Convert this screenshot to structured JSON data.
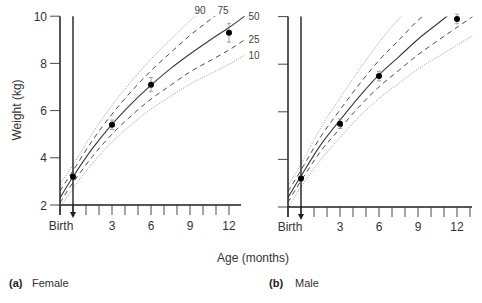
{
  "figure": {
    "ylabel": "Weight (kg)",
    "xlabel": "Age (months)",
    "panels": [
      {
        "tag": "(a)",
        "title": "Female"
      },
      {
        "tag": "(b)",
        "title": "Male"
      }
    ]
  },
  "chart_data": [
    {
      "type": "line",
      "title": "(a) Female",
      "xlabel": "Age (months)",
      "ylabel": "Weight (kg)",
      "xlim": [
        -1,
        13
      ],
      "ylim": [
        2,
        10
      ],
      "x_ticks": [
        0,
        3,
        6,
        9,
        12
      ],
      "x_tick_labels": [
        "Birth",
        "3",
        "6",
        "9",
        "12"
      ],
      "x_minor_ticks_every": 1,
      "y_ticks": [
        2,
        4,
        6,
        8,
        10
      ],
      "y_tick_labels": [
        "2",
        "4",
        "6",
        "8",
        "10"
      ],
      "grid": false,
      "birth_marker": {
        "x": 0,
        "style": "vertical arrow"
      },
      "series": [
        {
          "name": "90",
          "line_style": "dotted",
          "label_visible": true,
          "x": [
            -1,
            0,
            1.5,
            3,
            4.5,
            6,
            7.5,
            9,
            10.5
          ],
          "values": [
            2.9,
            3.7,
            5.05,
            6.22,
            7.25,
            8.18,
            9.0,
            9.8,
            10.5
          ]
        },
        {
          "name": "75",
          "line_style": "dashed",
          "label_visible": true,
          "x": [
            -1,
            0,
            1.5,
            3,
            4.5,
            6,
            7.5,
            9,
            10.5,
            12
          ],
          "values": [
            2.6,
            3.45,
            4.74,
            5.85,
            6.82,
            7.69,
            8.45,
            9.19,
            9.83,
            10.45
          ]
        },
        {
          "name": "50",
          "line_style": "solid",
          "label_visible": true,
          "x": [
            -1,
            0,
            1.5,
            3,
            4.5,
            6,
            7.5,
            9,
            10.5,
            12,
            13.2
          ],
          "values": [
            2.3,
            3.2,
            4.4,
            5.42,
            6.3,
            7.08,
            7.78,
            8.4,
            8.97,
            9.52,
            10.0
          ]
        },
        {
          "name": "25",
          "line_style": "dashed",
          "label_visible": true,
          "x": [
            -1,
            0,
            1.5,
            3,
            4.5,
            6,
            7.5,
            9,
            10.5,
            12,
            13.2
          ],
          "values": [
            2.1,
            2.95,
            4.06,
            5.0,
            5.79,
            6.49,
            7.07,
            7.64,
            8.1,
            8.57,
            9.0
          ]
        },
        {
          "name": "10",
          "line_style": "dotted",
          "label_visible": true,
          "x": [
            -1,
            0,
            1.5,
            3,
            4.5,
            6,
            7.5,
            9,
            10.5,
            12,
            13.2
          ],
          "values": [
            1.9,
            2.7,
            3.77,
            4.66,
            5.41,
            6.06,
            6.6,
            7.12,
            7.54,
            7.96,
            8.35
          ]
        }
      ],
      "points": {
        "name": "Measured weight",
        "x": [
          0,
          3,
          6,
          12
        ],
        "values": [
          3.2,
          5.4,
          7.1,
          9.3
        ],
        "error": [
          0.1,
          0.2,
          0.3,
          0.4
        ]
      }
    },
    {
      "type": "line",
      "title": "(b) Male",
      "xlabel": "Age (months)",
      "ylabel": "Weight (kg)",
      "xlim": [
        -1,
        13
      ],
      "ylim": [
        2,
        10
      ],
      "x_ticks": [
        0,
        3,
        6,
        9,
        12
      ],
      "x_tick_labels": [
        "Birth",
        "3",
        "6",
        "9",
        "12"
      ],
      "x_minor_ticks_every": 1,
      "y_ticks": [
        2,
        4,
        6,
        8,
        10
      ],
      "y_tick_labels": [],
      "grid": false,
      "birth_marker": {
        "x": 0,
        "style": "vertical arrow"
      },
      "series": [
        {
          "name": "90",
          "line_style": "dotted",
          "label_visible": false,
          "x": [
            -1,
            0,
            1.5,
            3,
            4.5,
            6,
            7.5,
            9
          ],
          "values": [
            2.9,
            3.8,
            5.31,
            6.58,
            7.79,
            8.91,
            9.88,
            10.6
          ]
        },
        {
          "name": "75",
          "line_style": "dashed",
          "label_visible": false,
          "x": [
            -1,
            0,
            1.5,
            3,
            4.5,
            6,
            7.5,
            9,
            10.5
          ],
          "values": [
            2.65,
            3.55,
            4.94,
            6.08,
            7.17,
            8.16,
            9.0,
            9.84,
            10.5
          ]
        },
        {
          "name": "50",
          "line_style": "solid",
          "label_visible": false,
          "x": [
            -1,
            0,
            1.5,
            3,
            4.5,
            6,
            7.5,
            9,
            10.5,
            12
          ],
          "values": [
            2.4,
            3.3,
            4.6,
            5.65,
            6.65,
            7.55,
            8.3,
            9.05,
            9.7,
            10.35
          ]
        },
        {
          "name": "25",
          "line_style": "dashed",
          "label_visible": false,
          "x": [
            -1,
            0,
            1.5,
            3,
            4.5,
            6,
            7.5,
            9,
            10.5,
            12,
            13.2
          ],
          "values": [
            2.2,
            3.1,
            4.33,
            5.3,
            6.23,
            7.05,
            7.73,
            8.4,
            8.98,
            9.55,
            10.0
          ]
        },
        {
          "name": "10",
          "line_style": "dotted",
          "label_visible": false,
          "x": [
            -1,
            0,
            1.5,
            3,
            4.5,
            6,
            7.5,
            9,
            10.5,
            12,
            13.2
          ],
          "values": [
            1.95,
            2.85,
            3.97,
            4.93,
            5.8,
            6.56,
            7.18,
            7.8,
            8.3,
            8.8,
            9.2
          ]
        }
      ],
      "points": {
        "name": "Measured weight",
        "x": [
          0,
          3,
          6,
          12
        ],
        "values": [
          3.2,
          5.5,
          7.5,
          9.9
        ],
        "error": [
          0.1,
          0.2,
          0.2,
          0.2
        ]
      }
    }
  ]
}
